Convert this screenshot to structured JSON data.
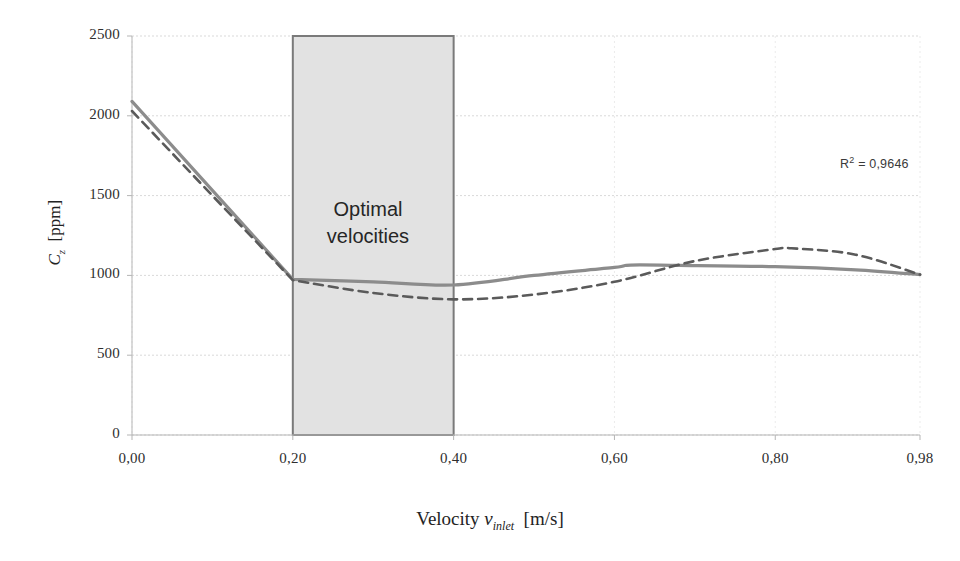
{
  "chart_data": {
    "type": "line",
    "title": "",
    "subtitle": "",
    "xlabel": "Velocity v_inlet  [m/s]",
    "ylabel": "C_z  [ppm]",
    "xlim": [
      0.0,
      0.98
    ],
    "ylim": [
      0,
      2500
    ],
    "grid": true,
    "legend_position": "none",
    "x_tick_labels": [
      "0,00",
      "0,20",
      "0,40",
      "0,60",
      "0,80",
      "0,98"
    ],
    "x_tick_values": [
      0.0,
      0.2,
      0.4,
      0.6,
      0.8,
      0.98
    ],
    "y_tick_labels": [
      "0",
      "500",
      "1000",
      "1500",
      "2000",
      "2500"
    ],
    "y_tick_values": [
      0,
      500,
      1000,
      1500,
      2000,
      2500
    ],
    "series": [
      {
        "name": "measured",
        "style": "solid",
        "color": "#8c8c8c",
        "x": [
          0.0,
          0.2,
          0.3,
          0.4,
          0.5,
          0.6,
          0.62,
          0.68,
          0.8,
          0.9,
          0.98
        ],
        "values": [
          2090,
          975,
          960,
          940,
          1000,
          1050,
          1065,
          1063,
          1055,
          1035,
          1005
        ]
      },
      {
        "name": "trendline",
        "style": "dashed",
        "color": "#5a5a5a",
        "x": [
          0.0,
          0.2,
          0.3,
          0.4,
          0.5,
          0.6,
          0.7,
          0.8,
          0.82,
          0.9,
          0.98
        ],
        "values": [
          2030,
          970,
          890,
          850,
          880,
          960,
          1090,
          1165,
          1170,
          1130,
          1005
        ]
      }
    ],
    "annotations": [
      {
        "name": "r2-annotation",
        "text": "R² = 0,9646",
        "x": 0.9,
        "y": 2150
      },
      {
        "name": "optimal-velocities-region",
        "text_line_1": "Optimal",
        "text_line_2": "velocities",
        "x_start": 0.2,
        "x_end": 0.4,
        "y_start": 0,
        "y_end": 2500,
        "fill": "#e2e2e2",
        "stroke": "#7a7a7a"
      }
    ]
  },
  "axis": {
    "y_title_main": "C",
    "y_title_sub": "z",
    "y_title_unit": "[ppm]",
    "x_title_main": "Velocity",
    "x_title_var": "v",
    "x_title_var_sub": "inlet",
    "x_title_unit": "[m/s]"
  },
  "colors": {
    "background": "#ffffff",
    "grid": "#d9d9d9",
    "axis": "#b5b5b5",
    "series_solid": "#8c8c8c",
    "series_dashed": "#5a5a5a",
    "region_fill": "#e2e2e2",
    "region_stroke": "#7a7a7a",
    "text": "#2e2e2e"
  }
}
